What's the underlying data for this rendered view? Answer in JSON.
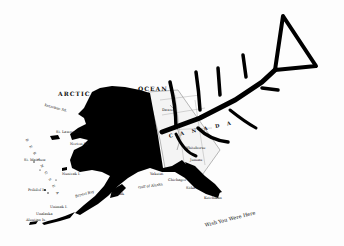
{
  "artwork": {
    "subject": "Map of Alaska blacked out with a fish skeleton drawn over it",
    "caption": "Wish You Were Here",
    "colors": {
      "ink": "#000000",
      "paper": "#ffffff",
      "map_lines": "#555555"
    }
  },
  "map": {
    "labels": {
      "arctic": "ARCTIC",
      "ocean": "OCEAN",
      "canada": "C A N A D A",
      "bering_sea": "B E R I N G   S E A",
      "norton_sd": "Norton Sd.",
      "kotzebue_sd": "Kotzebue Sd.",
      "nunivak": "Nunivak I.",
      "st_lawrence": "St. Lawrence I.",
      "st_matthew": "St. Matthew",
      "pribilof": "Pribilof Is.",
      "bristol_bay": "Bristol Bay",
      "kodiak": "Kodiak",
      "gulf_of_alaska": "Gulf of Alaska",
      "chichagof": "Chichagof",
      "sitka": "Sitka",
      "unimak": "Unimak I.",
      "unalaska": "Unalaska",
      "aleutian": "Aleutian Is.",
      "whitehorse": "Whitehorse",
      "dawson": "Dawson",
      "juneau": "Juneau",
      "yakutat": "Yakutat",
      "ketchikan": "Ketchikan"
    }
  }
}
